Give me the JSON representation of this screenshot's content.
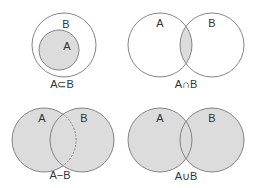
{
  "colors": {
    "fill": "#dcdcdc",
    "stroke": "#777777",
    "text": "#333333",
    "background": "#ffffff"
  },
  "diagrams": [
    {
      "id": "subset",
      "caption": "A⊂B",
      "labels": {
        "a": "A",
        "b": "B"
      }
    },
    {
      "id": "intersection",
      "caption": "A∩B",
      "labels": {
        "a": "A",
        "b": "B"
      }
    },
    {
      "id": "difference",
      "caption": "A−B",
      "labels": {
        "a": "A",
        "b": "B"
      }
    },
    {
      "id": "union",
      "caption": "A∪B",
      "labels": {
        "a": "A",
        "b": "B"
      }
    }
  ]
}
